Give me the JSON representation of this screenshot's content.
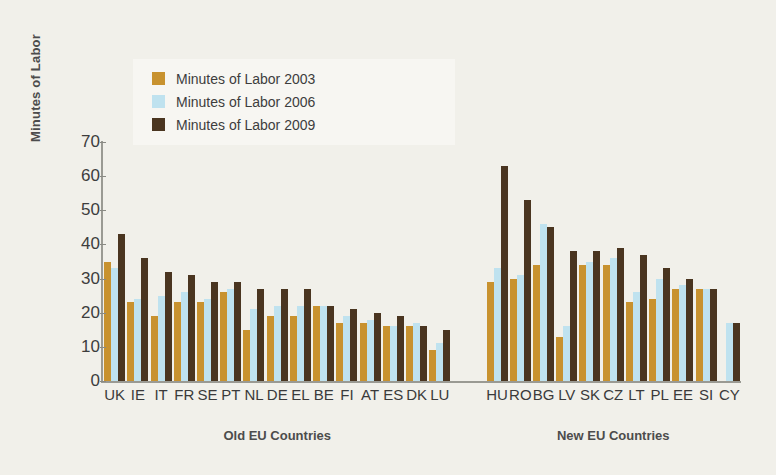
{
  "chart_data": {
    "type": "bar",
    "title": "",
    "xlabel": "",
    "ylabel": "Minutes of Labor",
    "ylim": [
      0,
      70
    ],
    "yticks": [
      0,
      10,
      20,
      30,
      40,
      50,
      60,
      70
    ],
    "grid": false,
    "legend_position": "top-left",
    "legend": [
      "Minutes of Labor 2003",
      "Minutes of Labor 2006",
      "Minutes of Labor 2009"
    ],
    "colors": {
      "2003": "#C8922F",
      "2006": "#BFE2EF",
      "2009": "#4A3520",
      "background": "#F1F0EA",
      "axis": "#9A9A93",
      "text": "#3D3D3D"
    },
    "groups": [
      {
        "name": "Old EU Countries",
        "categories": [
          "UK",
          "IE",
          "IT",
          "FR",
          "SE",
          "PT",
          "NL",
          "DE",
          "EL",
          "BE",
          "FI",
          "AT",
          "ES",
          "DK",
          "LU"
        ],
        "series": [
          {
            "name": "Minutes of Labor 2003",
            "values": [
              35,
              23,
              19,
              23,
              23,
              26,
              15,
              19,
              19,
              22,
              17,
              17,
              16,
              16,
              9
            ]
          },
          {
            "name": "Minutes of Labor 2006",
            "values": [
              33,
              24,
              25,
              26,
              24,
              27,
              21,
              22,
              22,
              22,
              19,
              18,
              16,
              17,
              11
            ]
          },
          {
            "name": "Minutes of Labor 2009",
            "values": [
              43,
              36,
              32,
              31,
              29,
              29,
              27,
              27,
              27,
              22,
              21,
              20,
              19,
              16,
              15
            ]
          }
        ]
      },
      {
        "name": "New EU Countries",
        "categories": [
          "HU",
          "RO",
          "BG",
          "LV",
          "SK",
          "CZ",
          "LT",
          "PL",
          "EE",
          "SI",
          "CY"
        ],
        "series": [
          {
            "name": "Minutes of Labor 2003",
            "values": [
              29,
              30,
              34,
              13,
              34,
              34,
              23,
              24,
              27,
              27,
              0
            ]
          },
          {
            "name": "Minutes of Labor 2006",
            "values": [
              33,
              31,
              46,
              16,
              35,
              36,
              26,
              30,
              28,
              27,
              17
            ]
          },
          {
            "name": "Minutes of Labor 2009",
            "values": [
              63,
              53,
              45,
              38,
              38,
              39,
              37,
              33,
              30,
              27,
              17
            ]
          }
        ]
      }
    ]
  }
}
